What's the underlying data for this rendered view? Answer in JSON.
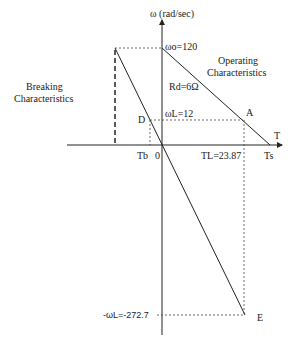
{
  "diagram": {
    "y_axis_label": "ω (rad/sec)",
    "x_axis_label": "T",
    "omega0": "ωo=120",
    "omegaL": "ωL=12",
    "rd": "Rd=6Ω",
    "neg_omegaL": "-ωL=-272.7",
    "TL": "TL=23.87",
    "Ts": "Ts",
    "Tb": "Tb",
    "origin": "0",
    "point_A": "A",
    "point_D": "D",
    "point_E": "E",
    "operating_1": "Operating",
    "operating_2": "Characteristics",
    "breaking_1": "Breaking",
    "breaking_2": "Characteristics"
  }
}
